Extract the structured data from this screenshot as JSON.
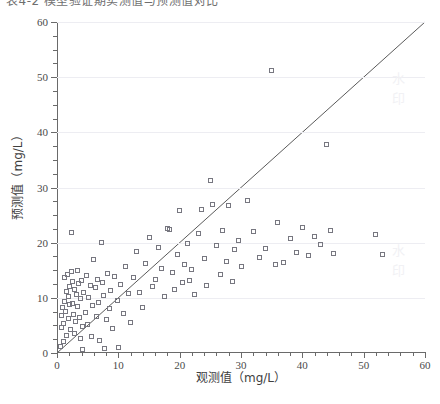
{
  "figure": {
    "top_caption_clipped": "表4-2 模型验证期实测值与预测值对比",
    "background_color": "#ffffff",
    "marker_color": "#777780",
    "line_color": "#5a5a5a",
    "grid_color": "#ededf2",
    "axis_color": "#6a6a6a"
  },
  "watermark_fragments": [
    "水",
    "印",
    "水",
    "印"
  ],
  "chart_data": {
    "type": "scatter",
    "title": "",
    "xlabel": "观测值（mg/L）",
    "ylabel": "预测值（mg/L）",
    "xlim": [
      0,
      60
    ],
    "ylim": [
      0,
      60
    ],
    "xticks": [
      0,
      10,
      20,
      30,
      40,
      50,
      60
    ],
    "yticks": [
      0,
      10,
      20,
      30,
      40,
      50,
      60
    ],
    "xtick_labels": [
      "0",
      "10",
      "20",
      "30",
      "40",
      "50",
      "60"
    ],
    "ytick_labels": [
      "0",
      "10",
      "20",
      "30",
      "40",
      "50",
      "60"
    ],
    "x_minor_step": 2,
    "y_minor_step": 2.5,
    "grid": "horizontal-major",
    "legend": null,
    "reference_line": {
      "label": "1:1",
      "slope": 1,
      "intercept": 0,
      "from": [
        0,
        0
      ],
      "to": [
        60,
        60
      ]
    },
    "marker": "open-square",
    "points": [
      [
        0.6,
        1.2
      ],
      [
        0.7,
        4.6
      ],
      [
        0.8,
        6.8
      ],
      [
        0.9,
        8.2
      ],
      [
        1.0,
        2.0
      ],
      [
        1.1,
        5.4
      ],
      [
        1.2,
        9.4
      ],
      [
        1.3,
        13.6
      ],
      [
        1.4,
        7.6
      ],
      [
        1.5,
        11.2
      ],
      [
        1.6,
        3.2
      ],
      [
        1.7,
        14.2
      ],
      [
        1.8,
        10.2
      ],
      [
        1.9,
        6.2
      ],
      [
        2.0,
        12.0
      ],
      [
        2.1,
        8.8
      ],
      [
        2.2,
        4.2
      ],
      [
        2.3,
        21.8
      ],
      [
        2.4,
        14.8
      ],
      [
        2.5,
        9.0
      ],
      [
        2.6,
        13.0
      ],
      [
        2.7,
        7.0
      ],
      [
        2.8,
        11.6
      ],
      [
        2.9,
        3.6
      ],
      [
        3.0,
        5.8
      ],
      [
        3.2,
        10.6
      ],
      [
        3.3,
        15.0
      ],
      [
        3.4,
        8.4
      ],
      [
        3.5,
        12.6
      ],
      [
        3.6,
        6.4
      ],
      [
        3.8,
        2.6
      ],
      [
        3.9,
        9.8
      ],
      [
        4.0,
        13.2
      ],
      [
        4.1,
        4.8
      ],
      [
        4.2,
        0.6
      ],
      [
        4.4,
        11.0
      ],
      [
        4.6,
        7.4
      ],
      [
        4.8,
        14.0
      ],
      [
        5.0,
        5.2
      ],
      [
        5.2,
        10.0
      ],
      [
        5.4,
        12.2
      ],
      [
        5.6,
        3.0
      ],
      [
        5.8,
        8.6
      ],
      [
        6.0,
        17.0
      ],
      [
        6.2,
        11.8
      ],
      [
        6.4,
        6.6
      ],
      [
        6.6,
        13.4
      ],
      [
        6.8,
        9.2
      ],
      [
        7.0,
        2.2
      ],
      [
        7.2,
        20.0
      ],
      [
        7.4,
        12.8
      ],
      [
        7.6,
        10.4
      ],
      [
        7.8,
        0.8
      ],
      [
        8.0,
        6.0
      ],
      [
        8.2,
        14.4
      ],
      [
        8.5,
        8.0
      ],
      [
        8.8,
        11.4
      ],
      [
        9.0,
        4.4
      ],
      [
        9.4,
        13.8
      ],
      [
        9.8,
        9.6
      ],
      [
        10.0,
        1.0
      ],
      [
        10.4,
        12.4
      ],
      [
        10.8,
        7.2
      ],
      [
        11.2,
        15.6
      ],
      [
        11.6,
        10.8
      ],
      [
        12.0,
        5.6
      ],
      [
        12.5,
        13.6
      ],
      [
        13.0,
        18.4
      ],
      [
        13.5,
        11.0
      ],
      [
        14.0,
        8.2
      ],
      [
        14.5,
        16.2
      ],
      [
        15.0,
        21.0
      ],
      [
        15.5,
        12.0
      ],
      [
        16.0,
        13.4
      ],
      [
        16.5,
        19.2
      ],
      [
        17.0,
        15.4
      ],
      [
        17.5,
        10.2
      ],
      [
        18.0,
        22.6
      ],
      [
        18.4,
        22.4
      ],
      [
        18.8,
        14.6
      ],
      [
        19.2,
        11.6
      ],
      [
        19.6,
        17.8
      ],
      [
        20.0,
        25.8
      ],
      [
        20.4,
        12.8
      ],
      [
        20.8,
        16.0
      ],
      [
        21.2,
        19.8
      ],
      [
        21.6,
        13.2
      ],
      [
        22.0,
        15.2
      ],
      [
        22.4,
        10.6
      ],
      [
        23.0,
        21.6
      ],
      [
        23.6,
        26.0
      ],
      [
        24.0,
        17.2
      ],
      [
        24.4,
        12.2
      ],
      [
        25.0,
        31.2
      ],
      [
        25.4,
        27.0
      ],
      [
        26.0,
        19.4
      ],
      [
        26.6,
        14.2
      ],
      [
        27.0,
        22.2
      ],
      [
        27.6,
        16.6
      ],
      [
        28.0,
        26.8
      ],
      [
        28.6,
        13.0
      ],
      [
        29.0,
        18.8
      ],
      [
        29.6,
        20.4
      ],
      [
        30.0,
        15.6
      ],
      [
        31.0,
        27.6
      ],
      [
        32.0,
        22.0
      ],
      [
        33.0,
        17.4
      ],
      [
        34.0,
        19.0
      ],
      [
        35.0,
        51.2
      ],
      [
        35.6,
        16.0
      ],
      [
        36.0,
        23.6
      ],
      [
        37.0,
        16.4
      ],
      [
        38.0,
        20.8
      ],
      [
        39.0,
        18.2
      ],
      [
        40.0,
        22.8
      ],
      [
        41.0,
        17.6
      ],
      [
        42.0,
        21.2
      ],
      [
        43.0,
        19.6
      ],
      [
        44.0,
        37.8
      ],
      [
        44.6,
        22.2
      ],
      [
        45.0,
        18.0
      ],
      [
        52.0,
        21.4
      ],
      [
        53.0,
        17.8
      ]
    ]
  }
}
